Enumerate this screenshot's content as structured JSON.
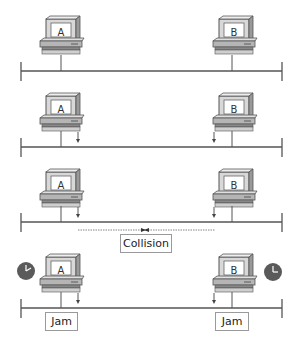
{
  "diagram": {
    "stations": [
      {
        "id": "A"
      },
      {
        "id": "B"
      }
    ],
    "panels": [
      {
        "step": 1,
        "A": "A",
        "B": "B",
        "transmitting": false
      },
      {
        "step": 2,
        "A": "A",
        "B": "B",
        "transmitting": true
      },
      {
        "step": 3,
        "A": "A",
        "B": "B",
        "transmitting": true,
        "label": "Collision"
      },
      {
        "step": 4,
        "A": "A",
        "B": "B",
        "transmitting": true,
        "jam_a": "Jam",
        "jam_b": "Jam",
        "backoff_timers": true
      }
    ],
    "colors": {
      "line": "#555555",
      "pc_light": "#e6e6e6",
      "pc_dark": "#7a7a7a",
      "clock": "#555555"
    }
  }
}
